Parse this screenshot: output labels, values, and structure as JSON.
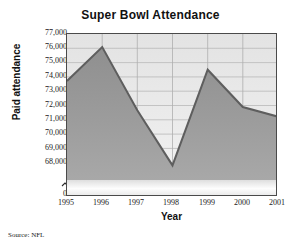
{
  "chart_data": {
    "type": "area",
    "title": "Super Bowl Attendance",
    "xlabel": "Year",
    "ylabel": "Paid attendance",
    "categories": [
      "1995",
      "1996",
      "1997",
      "1998",
      "1999",
      "2000",
      "2001"
    ],
    "values": [
      74100,
      76200,
      72300,
      68900,
      74800,
      72500,
      71900
    ],
    "series": [
      {
        "name": "Paid attendance",
        "values": [
          74100,
          76200,
          72300,
          68900,
          74800,
          72500,
          71900
        ]
      }
    ],
    "ylim": [
      68000,
      77000
    ],
    "y_ticks": [
      "0",
      "68,000",
      "69,000",
      "70,000",
      "71,000",
      "72,000",
      "73,000",
      "74,000",
      "75,000",
      "76,000",
      "77,000"
    ],
    "y_axis_broken": true,
    "y_axis_zero_label": "0",
    "grid": true,
    "legend": "none",
    "source_note": "Source: NFL",
    "line_color": "#6b6b6b",
    "fill_color": "#9a9a9a",
    "plot_background": "#ececec",
    "axis_color": "#4a4a4a"
  },
  "chart": {
    "title": "Super Bowl Attendance",
    "xlabel": "Year",
    "ylabel": "Paid attendance",
    "source": "Source: NFL",
    "y_ticks": [
      {
        "label": "77,000"
      },
      {
        "label": "76,000"
      },
      {
        "label": "75,000"
      },
      {
        "label": "74,000"
      },
      {
        "label": "73,000"
      },
      {
        "label": "72,000"
      },
      {
        "label": "71,000"
      },
      {
        "label": "70,000"
      },
      {
        "label": "69,000"
      },
      {
        "label": "68,000"
      },
      {
        "label": "0"
      }
    ],
    "x_ticks": [
      {
        "label": "1995"
      },
      {
        "label": "1996"
      },
      {
        "label": "1997"
      },
      {
        "label": "1998"
      },
      {
        "label": "1999"
      },
      {
        "label": "2000"
      },
      {
        "label": "2001"
      }
    ]
  }
}
